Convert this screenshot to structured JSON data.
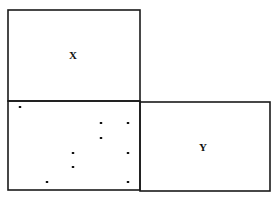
{
  "diagram": {
    "regions": [
      {
        "id": "X",
        "label": "X",
        "x": 8,
        "y": 10,
        "w": 132,
        "h": 91,
        "label_pos": [
          73,
          59
        ]
      },
      {
        "id": "dots",
        "label": "",
        "x": 8,
        "y": 101,
        "w": 132,
        "h": 89
      },
      {
        "id": "Y",
        "label": "Y",
        "x": 140,
        "y": 102,
        "w": 130,
        "h": 89,
        "label_pos": [
          203,
          151
        ]
      }
    ],
    "dots": [
      [
        20,
        107
      ],
      [
        101,
        123
      ],
      [
        128,
        123
      ],
      [
        101,
        138
      ],
      [
        73,
        153
      ],
      [
        128,
        153
      ],
      [
        73,
        167
      ],
      [
        47,
        182
      ],
      [
        128,
        182
      ]
    ]
  }
}
